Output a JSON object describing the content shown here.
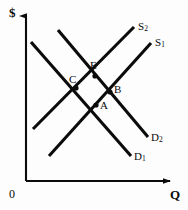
{
  "figure": {
    "type": "supply-demand-diagram",
    "background_color": "#fdfdfd",
    "stroke_color": "#0b0b0b"
  },
  "axes": {
    "y_axis_label": "$",
    "x_axis_label": "Q",
    "origin_label": "0",
    "y_axis": {
      "x": 26,
      "y_top": 16,
      "y_bottom": 181
    },
    "x_axis": {
      "y": 181,
      "x_left": 26,
      "x_right": 170
    }
  },
  "curves": [
    {
      "name": "S2",
      "label": "S",
      "subscript": "2",
      "kind": "supply",
      "x1": 33,
      "y1": 129,
      "x2": 134,
      "y2": 27,
      "label_x": 138,
      "label_y": 21
    },
    {
      "name": "S1",
      "label": "S",
      "subscript": "1",
      "kind": "supply",
      "x1": 49,
      "y1": 156,
      "x2": 151,
      "y2": 43,
      "label_x": 155,
      "label_y": 37
    },
    {
      "name": "D2",
      "label": "D",
      "subscript": "2",
      "kind": "demand",
      "x1": 58,
      "y1": 30,
      "x2": 148,
      "y2": 137,
      "label_x": 151,
      "label_y": 132
    },
    {
      "name": "D1",
      "label": "D",
      "subscript": "1",
      "kind": "demand",
      "x1": 31,
      "y1": 42,
      "x2": 131,
      "y2": 156,
      "label_x": 134,
      "label_y": 151
    }
  ],
  "points": [
    {
      "name": "E",
      "label": "E",
      "x": 95,
      "y": 76,
      "label_x": 90,
      "label_y": 60,
      "curves": [
        "S2",
        "D2"
      ]
    },
    {
      "name": "C",
      "label": "C",
      "x": 76,
      "y": 88,
      "label_x": 69,
      "label_y": 74,
      "curves": [
        "S2",
        "D1"
      ]
    },
    {
      "name": "B",
      "label": "B",
      "x": 110,
      "y": 92,
      "label_x": 114,
      "label_y": 84,
      "curves": [
        "S1",
        "D2"
      ]
    },
    {
      "name": "A",
      "label": "A",
      "x": 96,
      "y": 105,
      "label_x": 100,
      "label_y": 100,
      "curves": [
        "S1",
        "D1"
      ]
    }
  ],
  "chart_data": {
    "type": "line",
    "title": "",
    "xlabel": "Q",
    "ylabel": "$",
    "grid": false,
    "legend": "none",
    "series": [
      {
        "name": "S2",
        "kind": "supply",
        "slope": "upward",
        "points": [
          [
            33,
            129
          ],
          [
            134,
            27
          ]
        ]
      },
      {
        "name": "S1",
        "kind": "supply",
        "slope": "upward",
        "points": [
          [
            49,
            156
          ],
          [
            151,
            43
          ]
        ]
      },
      {
        "name": "D2",
        "kind": "demand",
        "slope": "downward",
        "points": [
          [
            58,
            30
          ],
          [
            148,
            137
          ]
        ]
      },
      {
        "name": "D1",
        "kind": "demand",
        "slope": "downward",
        "points": [
          [
            31,
            42
          ],
          [
            131,
            156
          ]
        ]
      }
    ],
    "annotations": [
      {
        "text": "E",
        "x": 95,
        "y": 76
      },
      {
        "text": "C",
        "x": 76,
        "y": 88
      },
      {
        "text": "B",
        "x": 110,
        "y": 92
      },
      {
        "text": "A",
        "x": 96,
        "y": 105
      }
    ]
  }
}
